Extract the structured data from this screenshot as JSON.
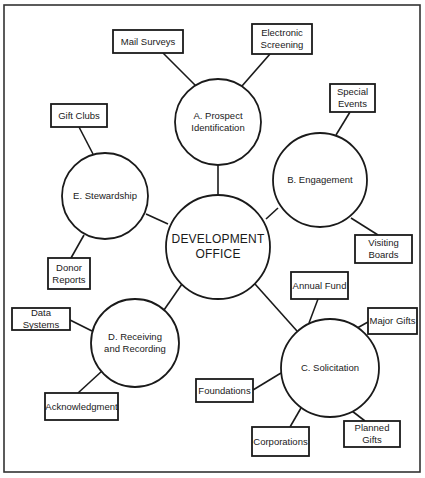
{
  "diagram": {
    "center": {
      "label": "DEVELOPMENT\nOFFICE"
    },
    "functions": [
      {
        "id": "A",
        "label": "A.  Prospect\nIdentification",
        "activities": [
          "Mail Surveys",
          "Electronic Screening"
        ]
      },
      {
        "id": "B",
        "label": "B.  Engagement",
        "activities": [
          "Special Events",
          "Visiting Boards"
        ]
      },
      {
        "id": "C",
        "label": "C.  Solicitation",
        "activities": [
          "Annual Fund",
          "Major Gifts",
          "Planned Gifts",
          "Corporations",
          "Foundations"
        ]
      },
      {
        "id": "D",
        "label": "D.  Receiving\nand Recording",
        "activities": [
          "Data Systems",
          "Acknowledgment"
        ]
      },
      {
        "id": "E",
        "label": "E.  Stewardship",
        "activities": [
          "Gift Clubs",
          "Donor Reports"
        ]
      }
    ],
    "boxes": {
      "mail_surveys": "Mail Surveys",
      "electronic_screening": "Electronic\nScreening",
      "gift_clubs": "Gift Clubs",
      "special_events": "Special\nEvents",
      "donor_reports": "Donor\nReports",
      "visiting_boards": "Visiting\nBoards",
      "annual_fund": "Annual Fund",
      "data_systems": "Data\nSystems",
      "major_gifts": "Major Gifts",
      "foundations": "Foundations",
      "acknowledgment": "Acknowledgment",
      "corporations": "Corporations",
      "planned_gifts": "Planned\nGifts"
    },
    "colors": {
      "stroke": "#1a1a1a",
      "background": "#ffffff"
    }
  }
}
